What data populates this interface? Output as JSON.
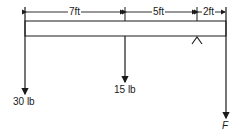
{
  "diagram": {
    "type": "beam-free-body",
    "dimensions": [
      {
        "label": "7ft",
        "from_x": 25,
        "to_x": 125
      },
      {
        "label": "5ft",
        "from_x": 125,
        "to_x": 197
      },
      {
        "label": "2ft",
        "from_x": 197,
        "to_x": 226
      }
    ],
    "loads": [
      {
        "label": "30 lb",
        "x": 25,
        "direction": "down"
      },
      {
        "label": "15 lb",
        "x": 125,
        "direction": "down"
      },
      {
        "label": "F",
        "x": 226,
        "direction": "down"
      }
    ],
    "support": {
      "type": "knife-edge",
      "x": 197
    },
    "colors": {
      "ink": "#1a1a1a",
      "background": "#ffffff"
    }
  }
}
